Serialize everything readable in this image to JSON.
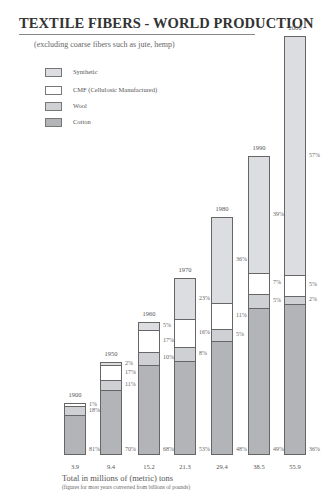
{
  "title": "TEXTILE FIBERS - WORLD PRODUCTION",
  "subtitle": "(excluding coarse fibers such as jute, hemp)",
  "legend": [
    {
      "label": "Synthetic",
      "color": "#dcdde0"
    },
    {
      "label": "CMF (Cellulosic Manufactured)",
      "color": "#ffffff"
    },
    {
      "label": "Wool",
      "color": "#cfd0d3"
    },
    {
      "label": "Cotton",
      "color": "#b3b4b8"
    }
  ],
  "footer": {
    "line1": "Total in millions of (metric) tons",
    "line2": "(figures for most years converted from billions of pounds)"
  },
  "chart_data": {
    "type": "bar",
    "stacked": true,
    "title": "TEXTILE FIBERS - WORLD PRODUCTION",
    "subtitle": "(excluding coarse fibers such as jute, hemp)",
    "xlabel": "Total in millions of (metric) tons",
    "note": "(figures for most years converted from billions of pounds)",
    "categories": [
      "1900",
      "1950",
      "1960",
      "1970",
      "1980",
      "1990",
      "2000"
    ],
    "totals": [
      3.9,
      9.4,
      15.2,
      21.3,
      29.4,
      38.5,
      55.9
    ],
    "total_labels": [
      "3.9",
      "9.4",
      "15.2",
      "21.3",
      "29.4",
      "38.5",
      "55.9"
    ],
    "series": [
      {
        "name": "Cotton",
        "values_pct": [
          81,
          70,
          68,
          53,
          48,
          49,
          36
        ],
        "labels": [
          "81%",
          "70%",
          "68%",
          "53%",
          "48%",
          "49%",
          "36%"
        ]
      },
      {
        "name": "Wool",
        "values_pct": [
          18,
          11,
          10,
          8,
          5,
          5,
          2
        ],
        "labels": [
          "18%",
          "11%",
          "10%",
          "8%",
          "5%",
          "5%",
          "2%"
        ]
      },
      {
        "name": "CMF (Cellulosic Manufactured)",
        "values_pct": [
          1,
          17,
          17,
          16,
          11,
          7,
          5
        ],
        "labels": [
          "1%",
          "17%",
          "17%",
          "16%",
          "11%",
          "7%",
          "5%"
        ]
      },
      {
        "name": "Synthetic",
        "values_pct": [
          0,
          2,
          5,
          23,
          36,
          39,
          57
        ],
        "labels": [
          "",
          "2%",
          "5%",
          "23%",
          "36%",
          "39%",
          "57%"
        ]
      }
    ],
    "legend_position": "top-left",
    "grid": false
  }
}
